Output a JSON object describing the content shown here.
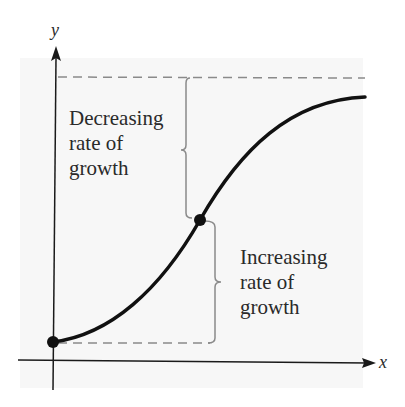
{
  "diagram": {
    "type": "logistic-growth-curve",
    "axes": {
      "x_label": "x",
      "y_label": "y"
    },
    "annotations": {
      "upper": {
        "text": "Decreasing\nrate of\ngrowth"
      },
      "lower": {
        "text": "Increasing\nrate of\ngrowth"
      }
    },
    "points": [
      {
        "name": "start",
        "x": 53,
        "y": 342
      },
      {
        "name": "inflection",
        "x": 200,
        "y": 220
      }
    ],
    "colors": {
      "curve": "#111111",
      "axis": "#1a1a1a",
      "dashed": "#8a8a8a",
      "brace": "#8a8a8a",
      "panel": "#f7f7f7"
    }
  }
}
